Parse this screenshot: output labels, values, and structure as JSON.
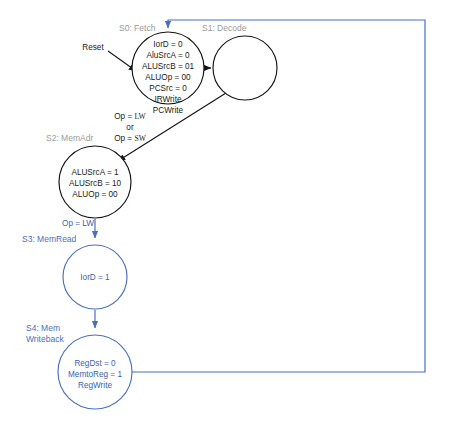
{
  "diagram": {
    "colors": {
      "black": "#141414",
      "blue": "#4a6fbf",
      "label_gray": "#9a9a9a",
      "background": "#ffffff"
    },
    "states": [
      {
        "id": "s0",
        "label": "S0: Fetch",
        "label_color": "gray",
        "color": "black",
        "cx": 168,
        "cy": 68,
        "r": 36,
        "lines": [
          "IorD = 0",
          "AluSrcA = 0",
          "ALUSrcB = 01",
          "ALUOp = 00",
          "PCSrc = 0",
          "IRWrite",
          "PCWrite"
        ]
      },
      {
        "id": "s1",
        "label": "S1: Decode",
        "label_color": "gray",
        "color": "black",
        "cx": 245,
        "cy": 68,
        "r": 32,
        "lines": []
      },
      {
        "id": "s2",
        "label": "S2: MemAdr",
        "label_color": "gray",
        "color": "black",
        "cx": 95,
        "cy": 182,
        "r": 36,
        "lines": [
          "ALUSrcA = 1",
          "ALUSrcB = 10",
          "ALUOp = 00"
        ]
      },
      {
        "id": "s3",
        "label": "S3: MemRead",
        "label_color": "blue",
        "color": "blue",
        "cx": 95,
        "cy": 277,
        "r": 32,
        "lines": [
          "IorD = 1"
        ]
      },
      {
        "id": "s4",
        "label_line1": "S4: Mem",
        "label_line2": "Writeback",
        "label_color": "blue",
        "color": "blue",
        "cx": 95,
        "cy": 372,
        "r": 37,
        "lines": [
          "RegDst = 0",
          "MemtoReg = 1",
          "RegWrite"
        ]
      }
    ],
    "edge_labels": {
      "reset": "Reset",
      "op_lw_italic": "LW",
      "op_sw_italic": "SW",
      "op_prefix": "Op = ",
      "or": "or",
      "op_lw_blue": "Op = LW"
    }
  }
}
